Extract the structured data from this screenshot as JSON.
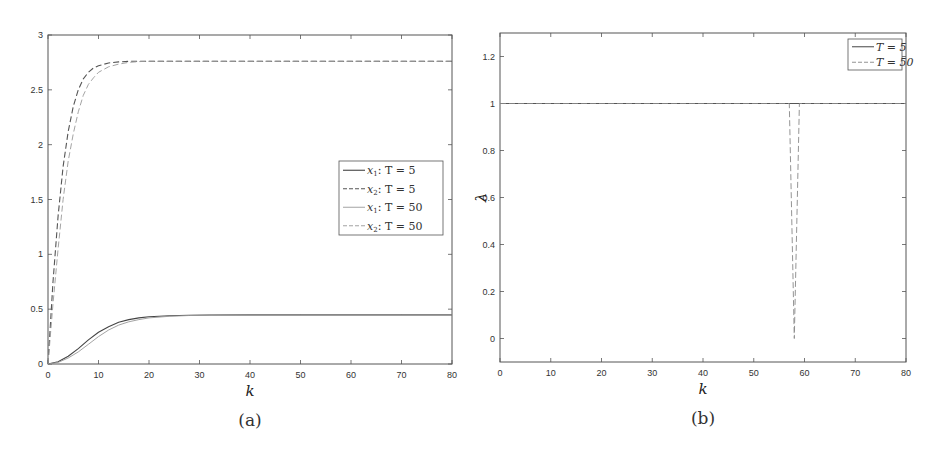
{
  "chart_data": [
    {
      "id": "a",
      "type": "line",
      "caption": "(a)",
      "title": "",
      "xlabel": "k",
      "ylabel": "",
      "xlim": [
        0,
        80
      ],
      "ylim": [
        0,
        3
      ],
      "xticks": [
        0,
        10,
        20,
        30,
        40,
        50,
        60,
        70,
        80
      ],
      "yticks": [
        0,
        0.5,
        1,
        1.5,
        2,
        2.5,
        3
      ],
      "ytick_labels": [
        "0",
        "0.5",
        "1",
        "1.5",
        "2",
        "2.5",
        "3"
      ],
      "grid": false,
      "legend": {
        "placement": "center-right",
        "entries": [
          {
            "var": "x",
            "sub": "1",
            "text": ": T = 5",
            "style": "solid"
          },
          {
            "var": "x",
            "sub": "2",
            "text": ": T = 5",
            "style": "dashed"
          },
          {
            "var": "x",
            "sub": "1",
            "text": ": T = 50",
            "style": "solid-light"
          },
          {
            "var": "x",
            "sub": "2",
            "text": ": T = 50",
            "style": "dashed-light"
          }
        ]
      },
      "series": [
        {
          "name": "x1: T = 5",
          "style": "solid",
          "color": "#444444",
          "x": [
            0,
            2,
            4,
            6,
            8,
            10,
            12,
            14,
            16,
            18,
            20,
            24,
            28,
            32,
            40,
            50,
            60,
            70,
            80
          ],
          "y": [
            0,
            0.02,
            0.07,
            0.14,
            0.22,
            0.29,
            0.34,
            0.38,
            0.405,
            0.42,
            0.43,
            0.44,
            0.445,
            0.447,
            0.448,
            0.448,
            0.448,
            0.448,
            0.448
          ]
        },
        {
          "name": "x2: T = 5",
          "style": "dashed",
          "color": "#555555",
          "x": [
            0,
            1,
            2,
            3,
            4,
            5,
            6,
            7,
            8,
            9,
            10,
            12,
            14,
            16,
            20,
            30,
            40,
            50,
            60,
            70,
            80
          ],
          "y": [
            0,
            0.75,
            1.35,
            1.8,
            2.12,
            2.35,
            2.5,
            2.6,
            2.66,
            2.7,
            2.72,
            2.745,
            2.755,
            2.76,
            2.76,
            2.76,
            2.76,
            2.76,
            2.76,
            2.76,
            2.76
          ]
        },
        {
          "name": "x1: T = 50",
          "style": "solid-light",
          "color": "#999999",
          "x": [
            0,
            2,
            4,
            6,
            8,
            10,
            12,
            14,
            16,
            18,
            20,
            24,
            28,
            32,
            40,
            50,
            60,
            70,
            80
          ],
          "y": [
            0,
            0.015,
            0.055,
            0.11,
            0.18,
            0.25,
            0.31,
            0.355,
            0.385,
            0.405,
            0.42,
            0.435,
            0.442,
            0.446,
            0.448,
            0.448,
            0.448,
            0.448,
            0.448
          ]
        },
        {
          "name": "x2: T = 50",
          "style": "dashed-light",
          "color": "#999999",
          "x": [
            0,
            1,
            2,
            3,
            4,
            5,
            6,
            7,
            8,
            9,
            10,
            12,
            14,
            16,
            18,
            20,
            30,
            40,
            50,
            60,
            70,
            80
          ],
          "y": [
            0,
            0.55,
            1.05,
            1.5,
            1.85,
            2.1,
            2.3,
            2.45,
            2.55,
            2.61,
            2.66,
            2.71,
            2.735,
            2.75,
            2.757,
            2.76,
            2.76,
            2.76,
            2.76,
            2.76,
            2.76,
            2.76
          ]
        }
      ]
    },
    {
      "id": "b",
      "type": "line",
      "caption": "(b)",
      "title": "",
      "xlabel": "k",
      "ylabel": "λ",
      "xlim": [
        0,
        80
      ],
      "ylim": [
        -0.1,
        1.3
      ],
      "xticks": [
        0,
        10,
        20,
        30,
        40,
        50,
        60,
        70,
        80
      ],
      "yticks": [
        0,
        0.2,
        0.4,
        0.6,
        0.8,
        1,
        1.2
      ],
      "ytick_labels": [
        "0",
        "0.2",
        "0.4",
        "0.6",
        "0.8",
        "1",
        "1.2"
      ],
      "grid": false,
      "legend": {
        "placement": "top-right",
        "entries": [
          {
            "text": "T = 5",
            "style": "solid"
          },
          {
            "text": "T = 50",
            "style": "dashed-light"
          }
        ]
      },
      "series": [
        {
          "name": "T = 5",
          "style": "solid",
          "color": "#555555",
          "x": [
            0,
            80
          ],
          "y": [
            1,
            1
          ]
        },
        {
          "name": "T = 50",
          "style": "dashed-light",
          "color": "#888888",
          "x": [
            0,
            57,
            58,
            59,
            80
          ],
          "y": [
            1,
            1,
            0,
            1,
            1
          ]
        }
      ]
    }
  ]
}
